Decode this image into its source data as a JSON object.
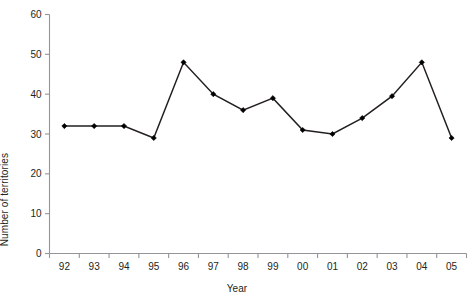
{
  "chart_data": {
    "type": "line",
    "title": "",
    "xlabel": "Year",
    "ylabel": "Number of territories",
    "categories": [
      "92",
      "93",
      "94",
      "95",
      "96",
      "97",
      "98",
      "99",
      "00",
      "01",
      "02",
      "03",
      "04",
      "05"
    ],
    "values": [
      32,
      32,
      32,
      29,
      48,
      40,
      36,
      39,
      31,
      30,
      34,
      39.5,
      48,
      29
    ],
    "series": [
      {
        "name": "Number of territories",
        "values": [
          32,
          32,
          32,
          29,
          48,
          40,
          36,
          39,
          31,
          30,
          34,
          39.5,
          48,
          29
        ]
      }
    ],
    "ylim": [
      0,
      60
    ],
    "yticks": [
      0,
      10,
      20,
      30,
      40,
      50,
      60
    ],
    "ytick_labels": [
      "0",
      "10",
      "20",
      "30",
      "40",
      "50",
      "60"
    ],
    "grid": false,
    "legend": false,
    "legend_position": "none",
    "line_color": "#231f20",
    "marker": "diamond",
    "marker_color": "#000000",
    "axis_color": "#939598"
  }
}
